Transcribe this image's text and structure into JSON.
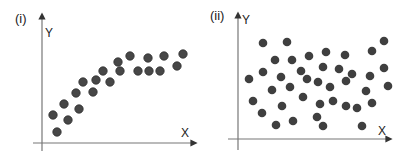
{
  "chart_data": [
    {
      "type": "scatter",
      "title": "(i)",
      "xlabel": "X",
      "ylabel": "Y",
      "grid": false,
      "description": "Positive, curvilinear (saturating) correlation",
      "points_px": [
        [
          53,
          115
        ],
        [
          57,
          132
        ],
        [
          64,
          104
        ],
        [
          68,
          120
        ],
        [
          76,
          93
        ],
        [
          79,
          109
        ],
        [
          83,
          82
        ],
        [
          93,
          92
        ],
        [
          96,
          80
        ],
        [
          103,
          71
        ],
        [
          110,
          82
        ],
        [
          118,
          62
        ],
        [
          120,
          71
        ],
        [
          130,
          56
        ],
        [
          138,
          71
        ],
        [
          148,
          58
        ],
        [
          149,
          71
        ],
        [
          160,
          71
        ],
        [
          164,
          56
        ],
        [
          177,
          66
        ],
        [
          183,
          54
        ]
      ],
      "axes_px": {
        "origin": [
          42,
          143
        ],
        "y_top": 14,
        "x_right": 196,
        "x_left": 33,
        "y_bottom": 151
      }
    },
    {
      "type": "scatter",
      "title": "(ii)",
      "xlabel": "X",
      "ylabel": "Y",
      "grid": false,
      "description": "No correlation (random scatter)",
      "points_px": [
        [
          263,
          43
        ],
        [
          287,
          42
        ],
        [
          275,
          60
        ],
        [
          292,
          60
        ],
        [
          309,
          56
        ],
        [
          326,
          52
        ],
        [
          345,
          55
        ],
        [
          372,
          51
        ],
        [
          384,
          41
        ],
        [
          249,
          79
        ],
        [
          263,
          72
        ],
        [
          281,
          77
        ],
        [
          301,
          71
        ],
        [
          307,
          79
        ],
        [
          318,
          82
        ],
        [
          323,
          67
        ],
        [
          339,
          69
        ],
        [
          352,
          74
        ],
        [
          346,
          81
        ],
        [
          370,
          76
        ],
        [
          384,
          68
        ],
        [
          388,
          86
        ],
        [
          272,
          90
        ],
        [
          290,
          87
        ],
        [
          330,
          87
        ],
        [
          366,
          91
        ],
        [
          253,
          101
        ],
        [
          303,
          97
        ],
        [
          282,
          106
        ],
        [
          320,
          104
        ],
        [
          333,
          101
        ],
        [
          346,
          106
        ],
        [
          357,
          108
        ],
        [
          372,
          103
        ],
        [
          262,
          113
        ],
        [
          317,
          117
        ],
        [
          276,
          125
        ],
        [
          293,
          121
        ],
        [
          323,
          126
        ],
        [
          362,
          126
        ]
      ],
      "axes_px": {
        "origin": [
          238,
          139
        ],
        "y_top": 13,
        "x_right": 391,
        "x_left": 228,
        "y_bottom": 150
      }
    }
  ],
  "panels": [
    {
      "label": "(i)",
      "x_axis": "X",
      "y_axis": "Y"
    },
    {
      "label": "(ii)",
      "x_axis": "X",
      "y_axis": "Y"
    }
  ]
}
